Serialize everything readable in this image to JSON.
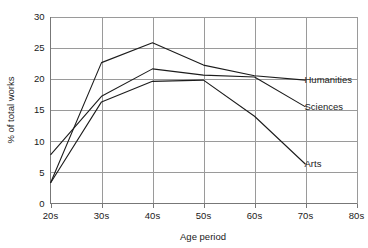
{
  "chart_data": {
    "type": "line",
    "title": "",
    "xlabel": "Age period",
    "ylabel": "% of total works",
    "categories": [
      "20s",
      "30s",
      "40s",
      "50s",
      "60s",
      "70s",
      "80s"
    ],
    "x_tick_labels": [
      "20s",
      "30s",
      "40s",
      "50s",
      "60s",
      "70s",
      "80s"
    ],
    "y_tick_labels": [
      "0",
      "5",
      "10",
      "15",
      "20",
      "25",
      "30"
    ],
    "y_ticks": [
      0,
      5,
      10,
      15,
      20,
      25,
      30
    ],
    "xlim": [
      "20s",
      "80s"
    ],
    "ylim": [
      0,
      30
    ],
    "grid": true,
    "grid_axes": "both",
    "legend_position": "inline-right-annotations",
    "series": [
      {
        "name": "Humanities",
        "label": "Humanities",
        "x": [
          "20s",
          "30s",
          "40s",
          "50s",
          "60s",
          "70s"
        ],
        "values": [
          3.3,
          22.6,
          25.8,
          22.2,
          20.5,
          19.8
        ],
        "color": "#1c1c1c"
      },
      {
        "name": "Sciences",
        "label": "Sciences",
        "x": [
          "20s",
          "30s",
          "40s",
          "50s",
          "60s",
          "70s"
        ],
        "values": [
          7.8,
          17.2,
          21.6,
          20.6,
          20.3,
          15.5
        ],
        "color": "#1c1c1c"
      },
      {
        "name": "Arts",
        "label": "Arts",
        "x": [
          "20s",
          "30s",
          "40s",
          "50s",
          "60s",
          "70s"
        ],
        "values": [
          3.3,
          16.3,
          19.6,
          19.8,
          14.0,
          6.3
        ],
        "color": "#1c1c1c"
      }
    ],
    "annotations": [
      {
        "text": "Humanities",
        "anchor_x": "70s",
        "anchor_y": 19.8
      },
      {
        "text": "Sciences",
        "anchor_x": "70s",
        "anchor_y": 15.5
      },
      {
        "text": "Arts",
        "anchor_x": "70s",
        "anchor_y": 6.3
      }
    ],
    "colors": {
      "background": "#ffffff",
      "grid": "#9a9a9a",
      "axis": "#777777",
      "line": "#1c1c1c",
      "text": "#1a1a1a"
    }
  }
}
